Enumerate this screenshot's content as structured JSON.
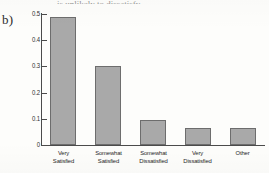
{
  "panel": {
    "label": "b)"
  },
  "title_sliver": {
    "text": "is unlikely to dissatisfy"
  },
  "chart_data": {
    "type": "bar",
    "title": "",
    "xlabel": "",
    "ylabel": "",
    "ylim": [
      0,
      0.5
    ],
    "ytick_labels": [
      "0.5",
      "0.4",
      "0.3",
      "0.2",
      "0.1",
      "0"
    ],
    "ytick_values": [
      0.5,
      0.4,
      0.3,
      0.2,
      0.1,
      0
    ],
    "grid": false,
    "legend": "none",
    "bar_color": "#a9a9a9",
    "bar_edge_color": "#6d6d6d",
    "categories": [
      "Very Satisfied",
      "Somewhat Satisfied",
      "Somewhat Dissatisfied",
      "Very Dissatisfied",
      "Other"
    ],
    "category_lines": [
      [
        "Very",
        "Satisfied"
      ],
      [
        "Somewhat",
        "Satisfied"
      ],
      [
        "Somewhat",
        "Dissatisfied"
      ],
      [
        "Very",
        "Dissatisfied"
      ],
      [
        "Other"
      ]
    ],
    "values": [
      0.49,
      0.3,
      0.095,
      0.065,
      0.065
    ]
  }
}
